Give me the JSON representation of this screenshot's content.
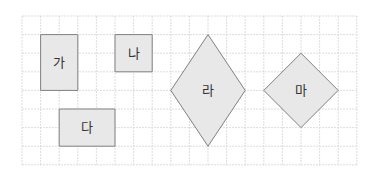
{
  "grid": {
    "origin_x": 22,
    "origin_y": 16,
    "cell": 18.6,
    "cols": 18,
    "rows": 8,
    "line_color": "#d4d4d4",
    "border_color": "#cfcfcf"
  },
  "style": {
    "fill": "#e8e8e8",
    "stroke": "#808080"
  },
  "shapes": [
    {
      "id": "ga",
      "label": "가",
      "kind": "rect",
      "points": [
        [
          1,
          1
        ],
        [
          3,
          1
        ],
        [
          3,
          4
        ],
        [
          1,
          4
        ]
      ],
      "label_at": [
        2,
        2.5
      ]
    },
    {
      "id": "na",
      "label": "나",
      "kind": "rect",
      "points": [
        [
          5,
          1
        ],
        [
          7,
          1
        ],
        [
          7,
          3
        ],
        [
          5,
          3
        ]
      ],
      "label_at": [
        6,
        2
      ]
    },
    {
      "id": "da",
      "label": "다",
      "kind": "rect",
      "points": [
        [
          2,
          5
        ],
        [
          5,
          5
        ],
        [
          5,
          7
        ],
        [
          2,
          7
        ]
      ],
      "label_at": [
        3.5,
        6
      ]
    },
    {
      "id": "ra",
      "label": "라",
      "kind": "rhombus",
      "points": [
        [
          10,
          1
        ],
        [
          12,
          4
        ],
        [
          10,
          7
        ],
        [
          8,
          4
        ]
      ],
      "label_at": [
        10,
        4
      ]
    },
    {
      "id": "ma",
      "label": "마",
      "kind": "square",
      "points": [
        [
          15,
          2
        ],
        [
          17,
          4
        ],
        [
          15,
          6
        ],
        [
          13,
          4
        ]
      ],
      "label_at": [
        15,
        4
      ]
    }
  ]
}
